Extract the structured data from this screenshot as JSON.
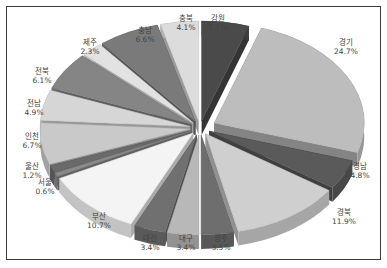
{
  "chart_data": {
    "type": "pie",
    "style": "3d-exploded",
    "title": "",
    "unit": "%",
    "categories": [
      "강원",
      "경기",
      "경남",
      "경북",
      "광주",
      "대구",
      "대전",
      "부산",
      "서울",
      "울산",
      "인천",
      "전남",
      "전북",
      "제주",
      "충남",
      "충북"
    ],
    "values": [
      5.1,
      24.7,
      4.8,
      11.9,
      3.5,
      3.4,
      3.4,
      10.7,
      0.6,
      1.2,
      6.7,
      4.9,
      6.1,
      2.3,
      6.6,
      4.1
    ],
    "labels": [
      "5.1%",
      "24.7%",
      "4.8%",
      "11.9%",
      "3.5%",
      "3.4%",
      "3.4%",
      "10.7%",
      "0.6%",
      "1.2%",
      "6.7%",
      "4.9%",
      "6.1%",
      "2.3%",
      "6.6%",
      "4.1%"
    ],
    "colors": [
      "#4a4a4a",
      "#bdbdbd",
      "#5a5a5a",
      "#cfcfcf",
      "#6e6e6e",
      "#b8b8b8",
      "#707070",
      "#f4f4f4",
      "#8a8a8a",
      "#6a6a6a",
      "#c9c9c9",
      "#d6d6d6",
      "#858585",
      "#e2e2e2",
      "#7a7a7a",
      "#dcdcdc"
    ],
    "label_positions": [
      [
        218,
        14
      ],
      [
        346,
        38
      ],
      [
        360,
        162
      ],
      [
        344,
        208
      ],
      [
        221,
        234
      ],
      [
        186,
        234
      ],
      [
        150,
        234
      ],
      [
        99,
        212
      ],
      [
        45,
        178
      ],
      [
        32,
        162
      ],
      [
        32,
        132
      ],
      [
        34,
        99
      ],
      [
        42,
        67
      ],
      [
        90,
        38
      ],
      [
        145,
        26
      ],
      [
        186,
        14
      ]
    ],
    "legend": "none"
  }
}
